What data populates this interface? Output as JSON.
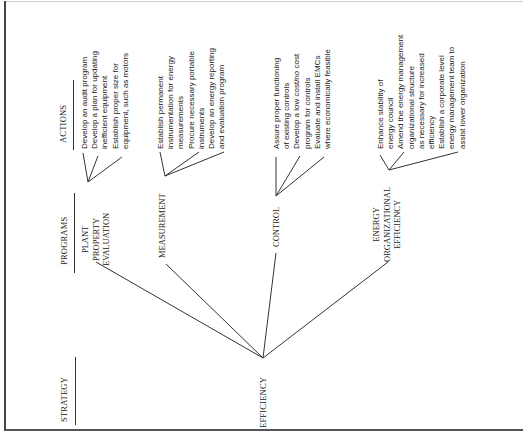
{
  "headers": {
    "strategy": "STRATEGY",
    "programs": "PROGRAMS",
    "actions": "ACTIONS"
  },
  "strategy": {
    "label": "EFFICIENCY"
  },
  "programs": [
    {
      "label_lines": [
        "PLANT",
        "PROPERTY",
        "EVALUATION"
      ],
      "actions": [
        "Develop an audit program",
        "Develop a plan for updating",
        "inefficient equipment",
        "Establish proper size for",
        "equipment, such as motors"
      ]
    },
    {
      "label_lines": [
        "MEASUREMENT"
      ],
      "actions": [
        "Establish permanent",
        "instrumentation for energy",
        "measurements",
        "Procure necessary portable",
        "instruments",
        "Develop an energy reporting",
        "and evaluation program"
      ]
    },
    {
      "label_lines": [
        "CONTROL"
      ],
      "actions": [
        "Assure proper functioning",
        "of existing controls",
        "Develop a low cost/no cost",
        "program for controls",
        "Evaluate and install EMCs",
        "where economically feasible"
      ]
    },
    {
      "label_lines": [
        "ENERGY",
        "ORGANIZATIONAL",
        "EFFICIENCY"
      ],
      "actions": [
        "Enhance stability of",
        "energy council",
        "Amend the energy management",
        "organizational structure",
        "as necessary for increased",
        "efficiency",
        "Establish a corporate level",
        "energy management team to",
        "assist lower organization"
      ]
    }
  ],
  "colors": {
    "line": "#333333",
    "text": "#222222",
    "background": "#ffffff"
  }
}
